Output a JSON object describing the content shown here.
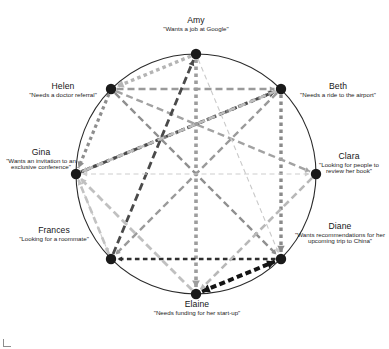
{
  "diagram": {
    "circle": {
      "center_x": 196,
      "center_y": 174,
      "radius": 120,
      "stroke": "#2b2b2b"
    },
    "node_color": "#1a1a1a",
    "node_radius": 5.2
  },
  "people": [
    {
      "id": "amy",
      "name": "Amy",
      "need": "\"Wants a job at Google\"",
      "angle_deg": 90,
      "x": 196,
      "y": 54,
      "label_left": 146,
      "label_top": 16,
      "label_width": 100
    },
    {
      "id": "beth",
      "name": "Beth",
      "need": "\"Needs a ride to the airport\"",
      "angle_deg": 45,
      "x": 281,
      "y": 89,
      "label_left": 296,
      "label_top": 82,
      "label_width": 84
    },
    {
      "id": "clara",
      "name": "Clara",
      "need": "\"Looking for people to review her book\"",
      "angle_deg": 0,
      "x": 316,
      "y": 174,
      "label_left": 312,
      "label_top": 152,
      "label_width": 74
    },
    {
      "id": "diane",
      "name": "Diane",
      "need": "\"Wants recommendations for her upcoming trip to China\"",
      "angle_deg": -45,
      "x": 281,
      "y": 259,
      "label_left": 294,
      "label_top": 222,
      "label_width": 92
    },
    {
      "id": "elaine",
      "name": "Elaine",
      "need": "\"Needs funding for her start-up\"",
      "angle_deg": -90,
      "x": 196,
      "y": 294,
      "label_left": 149,
      "label_top": 300,
      "label_width": 96
    },
    {
      "id": "frances",
      "name": "Frances",
      "need": "\"Looking for a roommate\"",
      "angle_deg": -135,
      "x": 111,
      "y": 259,
      "label_left": 12,
      "label_top": 226,
      "label_width": 84
    },
    {
      "id": "gina",
      "name": "Gina",
      "need": "\"Wants an invitation to an exclusive conference\"",
      "angle_deg": 180,
      "x": 76,
      "y": 174,
      "label_left": 6,
      "label_top": 148,
      "label_width": 70
    },
    {
      "id": "helen",
      "name": "Helen",
      "need": "\"Needs a doctor referral\"",
      "angle_deg": 135,
      "x": 111,
      "y": 89,
      "label_left": 22,
      "label_top": 82,
      "label_width": 82
    }
  ],
  "edges": [
    {
      "id": "amy-helen",
      "from": "amy",
      "to": "helen",
      "color": "#b4b4b4",
      "width": 3.4,
      "dash": "3.6,3.2",
      "arrow": "end",
      "style": "dotted-thick"
    },
    {
      "id": "gina-beth",
      "from": "gina",
      "to": "beth",
      "color": "#7e7e7e",
      "width": 3.4,
      "dash": "3.6,3.2",
      "arrow": "end",
      "style": "dotted-thick"
    },
    {
      "id": "helen-gina-dot",
      "from": "helen",
      "to": "gina",
      "color": "#8e8e8e",
      "width": 3.2,
      "dash": "3.4,3.2",
      "arrow": "end",
      "style": "dotted-thick"
    },
    {
      "id": "amy-elaine",
      "from": "amy",
      "to": "elaine",
      "color": "#9d9d9d",
      "width": 3.6,
      "dash": "3.6,3.4",
      "arrow": "end",
      "style": "dotted-thick"
    },
    {
      "id": "beth-diane",
      "from": "beth",
      "to": "diane",
      "color": "#8a8a8a",
      "width": 3.4,
      "dash": "3.6,3.4",
      "arrow": "end",
      "style": "dotted-thick"
    },
    {
      "id": "helen-beth",
      "from": "helen",
      "to": "beth",
      "color": "#9a9a9a",
      "width": 2.4,
      "dash": "7,4",
      "arrow": "end",
      "style": "dashed"
    },
    {
      "id": "helen-clara",
      "from": "helen",
      "to": "clara",
      "color": "#a2a2a2",
      "width": 2.4,
      "dash": "7,4",
      "arrow": "end",
      "style": "dashed"
    },
    {
      "id": "helen-diane",
      "from": "helen",
      "to": "diane",
      "color": "#8f8f8f",
      "width": 2.4,
      "dash": "7,4",
      "arrow": "end",
      "style": "dashed"
    },
    {
      "id": "beth-frances",
      "from": "beth",
      "to": "frances",
      "color": "#9a9a9a",
      "width": 2.4,
      "dash": "7,4",
      "arrow": "end",
      "style": "dashed"
    },
    {
      "id": "frances-amy",
      "from": "frances",
      "to": "amy",
      "color": "#4a4a4a",
      "width": 2.8,
      "dash": "7.5,4",
      "arrow": "end",
      "style": "dashed-dark"
    },
    {
      "id": "gina-beth-dk",
      "from": "gina",
      "to": "beth",
      "color": "#4a4a4a",
      "width": 2.8,
      "dash": "7.5,4",
      "arrow": "end",
      "style": "dashed-dark"
    },
    {
      "id": "diane-frances",
      "from": "diane",
      "to": "frances",
      "color": "#2f2f2f",
      "width": 2.3,
      "dash": "4.6,3.4",
      "arrow": "end",
      "style": "dashed-dark"
    },
    {
      "id": "elaine-diane",
      "from": "elaine",
      "to": "diane",
      "color": "#141414",
      "width": 4.0,
      "dash": "6,3.4",
      "arrow": "both",
      "style": "heavy"
    },
    {
      "id": "gina-clara",
      "from": "gina",
      "to": "clara",
      "color": "#cdcdcd",
      "width": 1.1,
      "dash": "5,3.5",
      "arrow": "both",
      "style": "thin"
    },
    {
      "id": "amy-diane",
      "from": "amy",
      "to": "diane",
      "color": "#c9c9c9",
      "width": 1.1,
      "dash": "5,3.5",
      "arrow": "end",
      "style": "thin"
    },
    {
      "id": "gina-frances",
      "from": "gina",
      "to": "frances",
      "color": "#cfcfcf",
      "width": 1.2,
      "dash": "5,3.5",
      "arrow": "end",
      "style": "thin"
    },
    {
      "id": "frances-gina",
      "from": "frances",
      "to": "gina",
      "color": "#c2c2c2",
      "width": 2.6,
      "dash": "7,4",
      "arrow": "end",
      "style": "dashed-light"
    },
    {
      "id": "elaine-gina",
      "from": "elaine",
      "to": "gina",
      "color": "#c0c0c0",
      "width": 2.8,
      "dash": "7.5,4",
      "arrow": "end",
      "style": "dashed-light"
    },
    {
      "id": "clara-elaine",
      "from": "clara",
      "to": "elaine",
      "color": "#b8b8b8",
      "width": 2.6,
      "dash": "7,4",
      "arrow": "end",
      "style": "dashed-light"
    },
    {
      "id": "beth-gina-lt",
      "from": "beth",
      "to": "gina",
      "color": "#bdbdbd",
      "width": 2.6,
      "dash": "7,4",
      "arrow": "end",
      "style": "dashed-light"
    }
  ]
}
